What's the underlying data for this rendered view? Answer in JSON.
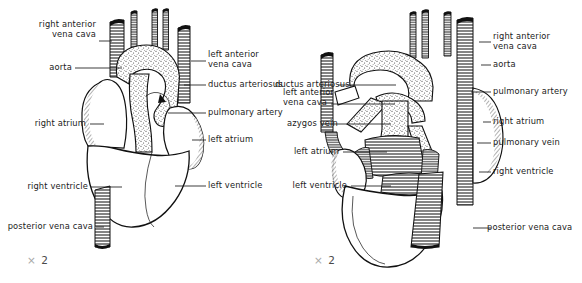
{
  "figure": {
    "type": "anatomical-illustration",
    "background_color": "#ffffff",
    "ink_color": "#1b1b1b",
    "magnification_symbol": "×",
    "magnification_value": "2"
  },
  "panels": [
    {
      "id": "ventral",
      "name": "ventral-view",
      "magnification": "× 2",
      "labels_left": [
        {
          "text": "right anterior\nvena cava",
          "name": "label-right-anterior-vena-cava"
        },
        {
          "text": "aorta",
          "name": "label-aorta"
        },
        {
          "text": "right atrium",
          "name": "label-right-atrium"
        },
        {
          "text": "right ventricle",
          "name": "label-right-ventricle"
        },
        {
          "text": "posterior vena cava",
          "name": "label-posterior-vena-cava"
        }
      ],
      "labels_right": [
        {
          "text": "left anterior\nvena cava",
          "name": "label-left-anterior-vena-cava"
        },
        {
          "text": "ductus arteriosus",
          "name": "label-ductus-arteriosus"
        },
        {
          "text": "pulmonary artery",
          "name": "label-pulmonary-artery"
        },
        {
          "text": "left atrium",
          "name": "label-left-atrium"
        },
        {
          "text": "left ventricle",
          "name": "label-left-ventricle"
        }
      ]
    },
    {
      "id": "dorsal",
      "name": "dorsal-view",
      "magnification": "× 2",
      "labels_left": [
        {
          "text": "ductus arteriosus",
          "name": "label-ductus-arteriosus"
        },
        {
          "text": "left anterior\nvena cava",
          "name": "label-left-anterior-vena-cava"
        },
        {
          "text": "azygos vein",
          "name": "label-azygos-vein"
        },
        {
          "text": "left atrium",
          "name": "label-left-atrium"
        },
        {
          "text": "left ventricle",
          "name": "label-left-ventricle"
        }
      ],
      "labels_right": [
        {
          "text": "right anterior\nvena cava",
          "name": "label-right-anterior-vena-cava"
        },
        {
          "text": "aorta",
          "name": "label-aorta"
        },
        {
          "text": "pulmonary artery",
          "name": "label-pulmonary-artery"
        },
        {
          "text": "right atrium",
          "name": "label-right-atrium"
        },
        {
          "text": "pulmonary vein",
          "name": "label-pulmonary-vein"
        },
        {
          "text": "right ventricle",
          "name": "label-right-ventricle"
        },
        {
          "text": "posterior vena cava",
          "name": "label-posterior-vena-cava"
        }
      ]
    }
  ],
  "labels": {
    "v_l0": "right anterior\nvena cava",
    "v_l1": "aorta",
    "v_l2": "right atrium",
    "v_l3": "right ventricle",
    "v_l4": "posterior vena cava",
    "v_r0": "left anterior\nvena cava",
    "v_r1": "ductus arteriosus",
    "v_r2": "pulmonary artery",
    "v_r3": "left atrium",
    "v_r4": "left ventricle",
    "v_mag": "2",
    "d_l0": "ductus arteriosus",
    "d_l1": "left anterior\nvena cava",
    "d_l2": "azygos vein",
    "d_l3": "left atrium",
    "d_l4": "left ventricle",
    "d_r0": "right anterior\nvena cava",
    "d_r1": "aorta",
    "d_r2": "pulmonary artery",
    "d_r3": "right atrium",
    "d_r4": "pulmonary vein",
    "d_r5": "right ventricle",
    "d_r6": "posterior vena cava",
    "d_mag": "2",
    "mag_x": "×"
  }
}
